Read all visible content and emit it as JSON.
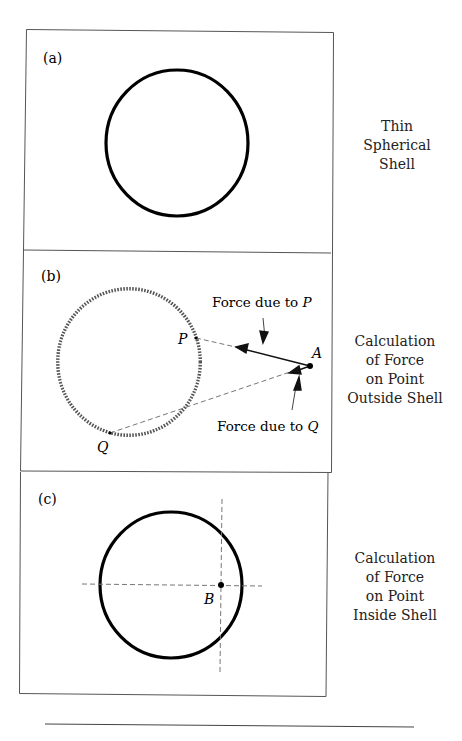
{
  "panels": [
    {
      "id": "a",
      "label": "(a)",
      "caption": [
        "Thin",
        "Spherical",
        "Shell"
      ]
    },
    {
      "id": "b",
      "label": "(b)",
      "caption": [
        "Calculation",
        "of Force",
        "on Point",
        "Outside Shell"
      ],
      "annotations": {
        "force_p": "Force due to ",
        "force_p_var": "P",
        "force_q": "Force due to ",
        "force_q_var": "Q",
        "point_p": "P",
        "point_q": "Q",
        "point_a": "A"
      }
    },
    {
      "id": "c",
      "label": "(c)",
      "caption": [
        "Calculation",
        "of Force",
        "on Point",
        "Inside Shell"
      ],
      "annotations": {
        "point_b": "B"
      }
    }
  ]
}
